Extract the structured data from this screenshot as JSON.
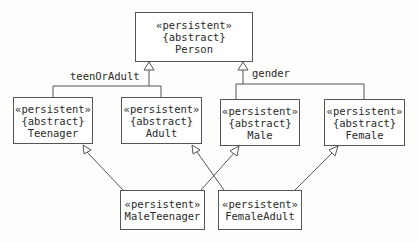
{
  "diagram": {
    "type": "UML class diagram",
    "classes": [
      {
        "id": "person",
        "stereotype": "«persistent»",
        "constraint": "{abstract}",
        "name": "Person"
      },
      {
        "id": "teenager",
        "stereotype": "«persistent»",
        "constraint": "{abstract}",
        "name": "Teenager"
      },
      {
        "id": "adult",
        "stereotype": "«persistent»",
        "constraint": "{abstract}",
        "name": "Adult"
      },
      {
        "id": "male",
        "stereotype": "«persistent»",
        "constraint": "{abstract}",
        "name": "Male"
      },
      {
        "id": "female",
        "stereotype": "«persistent»",
        "constraint": "{abstract}",
        "name": "Female"
      },
      {
        "id": "maleteenager",
        "stereotype": "«persistent»",
        "name": "MaleTeenager"
      },
      {
        "id": "femaleadult",
        "stereotype": "«persistent»",
        "name": "FemaleAdult"
      }
    ],
    "generalization_sets": [
      {
        "label": "teenOrAdult",
        "parent": "Person",
        "children": [
          "Teenager",
          "Adult"
        ]
      },
      {
        "label": "gender",
        "parent": "Person",
        "children": [
          "Male",
          "Female"
        ]
      }
    ],
    "generalizations": [
      {
        "child": "MaleTeenager",
        "parent": "Teenager"
      },
      {
        "child": "MaleTeenager",
        "parent": "Male"
      },
      {
        "child": "FemaleAdult",
        "parent": "Adult"
      },
      {
        "child": "FemaleAdult",
        "parent": "Female"
      }
    ],
    "colors": {
      "line": "#555555",
      "text": "#2a2a2a",
      "background": "#fdfdfb"
    }
  }
}
